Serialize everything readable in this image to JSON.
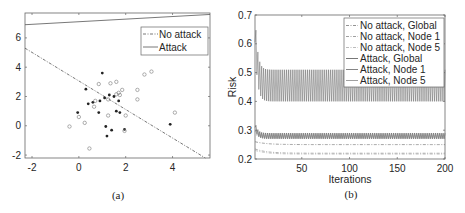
{
  "chart_data": [
    {
      "type": "scatter",
      "panel_caption": "(a)",
      "title": "",
      "xlabel": "",
      "ylabel": "",
      "xlim": [
        -2.3,
        5.6
      ],
      "ylim": [
        -2.2,
        7.7
      ],
      "xticks": [
        "-2",
        "0",
        "2",
        "4"
      ],
      "yticks": [
        "-2",
        "0",
        "2",
        "4",
        "6"
      ],
      "grid": false,
      "legend_position": "upper right",
      "legend": [
        {
          "label": "No attack",
          "style": "dashdot"
        },
        {
          "label": "Attack",
          "style": "solid"
        }
      ],
      "lines": [
        {
          "name": "No attack",
          "style": "dashdot",
          "points": [
            [
              -2.3,
              5.3
            ],
            [
              5.4,
              -2.2
            ]
          ]
        },
        {
          "name": "Attack",
          "style": "solid",
          "points": [
            [
              -2.3,
              6.9
            ],
            [
              5.6,
              7.6
            ]
          ]
        }
      ],
      "series": [
        {
          "name": "class-filled",
          "marker": "filled-dot",
          "points": [
            [
              1.0,
              3.6
            ],
            [
              0.3,
              2.5
            ],
            [
              1.3,
              2.1
            ],
            [
              1.5,
              2.0
            ],
            [
              1.1,
              1.9
            ],
            [
              0.9,
              1.7
            ],
            [
              0.6,
              1.6
            ],
            [
              0.4,
              1.5
            ],
            [
              1.7,
              1.7
            ],
            [
              -0.05,
              0.9
            ],
            [
              0.85,
              0.9
            ],
            [
              1.6,
              1.0
            ],
            [
              1.75,
              0.9
            ],
            [
              1.15,
              -0.05
            ],
            [
              1.4,
              -0.3
            ],
            [
              1.95,
              -0.25
            ],
            [
              1.2,
              -0.7
            ],
            [
              3.9,
              0.1
            ]
          ]
        },
        {
          "name": "class-hollow",
          "marker": "open-circle",
          "points": [
            [
              3.1,
              3.7
            ],
            [
              2.8,
              3.5
            ],
            [
              1.6,
              3.0
            ],
            [
              1.35,
              2.9
            ],
            [
              0.85,
              2.85
            ],
            [
              2.5,
              2.45
            ],
            [
              1.85,
              2.45
            ],
            [
              1.7,
              2.25
            ],
            [
              1.6,
              2.15
            ],
            [
              1.75,
              2.1
            ],
            [
              2.5,
              1.8
            ],
            [
              0.7,
              1.7
            ],
            [
              1.25,
              1.8
            ],
            [
              0.65,
              1.3
            ],
            [
              1.25,
              0.7
            ],
            [
              2.0,
              0.7
            ],
            [
              4.1,
              0.9
            ],
            [
              0.0,
              0.6
            ],
            [
              0.25,
              0.2
            ],
            [
              -0.4,
              -0.05
            ],
            [
              1.95,
              -0.35
            ],
            [
              0.45,
              -1.55
            ]
          ]
        }
      ]
    },
    {
      "type": "line",
      "panel_caption": "(b)",
      "title": "",
      "xlabel": "Iterations",
      "ylabel": "Risk",
      "xlim": [
        1,
        200
      ],
      "ylim": [
        0.2,
        0.7
      ],
      "xticks": [
        "50",
        "100",
        "150",
        "200"
      ],
      "yticks": [
        "0.2",
        "0.3",
        "0.4",
        "0.5",
        "0.6",
        "0.7"
      ],
      "grid": false,
      "legend_position": "upper right",
      "legend": [
        {
          "label": "No attack, Global",
          "style": "dashdot"
        },
        {
          "label": "No attack, Node 1",
          "style": "dashdot"
        },
        {
          "label": "No attack, Node 5",
          "style": "dashdot"
        },
        {
          "label": "Attack, Global",
          "style": "solid"
        },
        {
          "label": "Attack, Node 1",
          "style": "solid"
        },
        {
          "label": "Attack, Node 5",
          "style": "solid"
        }
      ],
      "series": [
        {
          "name": "No attack, Global",
          "summary": "starts ~0.26, settles ~0.25",
          "start": 0.26,
          "steady": 0.25
        },
        {
          "name": "No attack, Node 1",
          "summary": "starts ~0.235, settles ~0.22",
          "start": 0.235,
          "steady": 0.22
        },
        {
          "name": "No attack, Node 5",
          "summary": "starts ~0.23, settles ~0.215",
          "start": 0.23,
          "steady": 0.217
        },
        {
          "name": "Attack, Global",
          "summary": "spike ~0.32 at start, oscillates 0.27-0.29",
          "start": 0.32,
          "osc_min": 0.27,
          "osc_max": 0.29
        },
        {
          "name": "Attack, Node 1",
          "summary": "spike ~0.66 at start, oscillates 0.40-0.51",
          "start": 0.66,
          "osc_min": 0.4,
          "osc_max": 0.51
        },
        {
          "name": "Attack, Node 5",
          "summary": "oscillates 0.27-0.285",
          "start": 0.3,
          "osc_min": 0.272,
          "osc_max": 0.285
        }
      ]
    }
  ],
  "colors": {
    "axis": "#555555",
    "line_dark": "#4a4a4a",
    "line_mid": "#777777",
    "line_light": "#9a9a9a",
    "marker": "#333333"
  }
}
